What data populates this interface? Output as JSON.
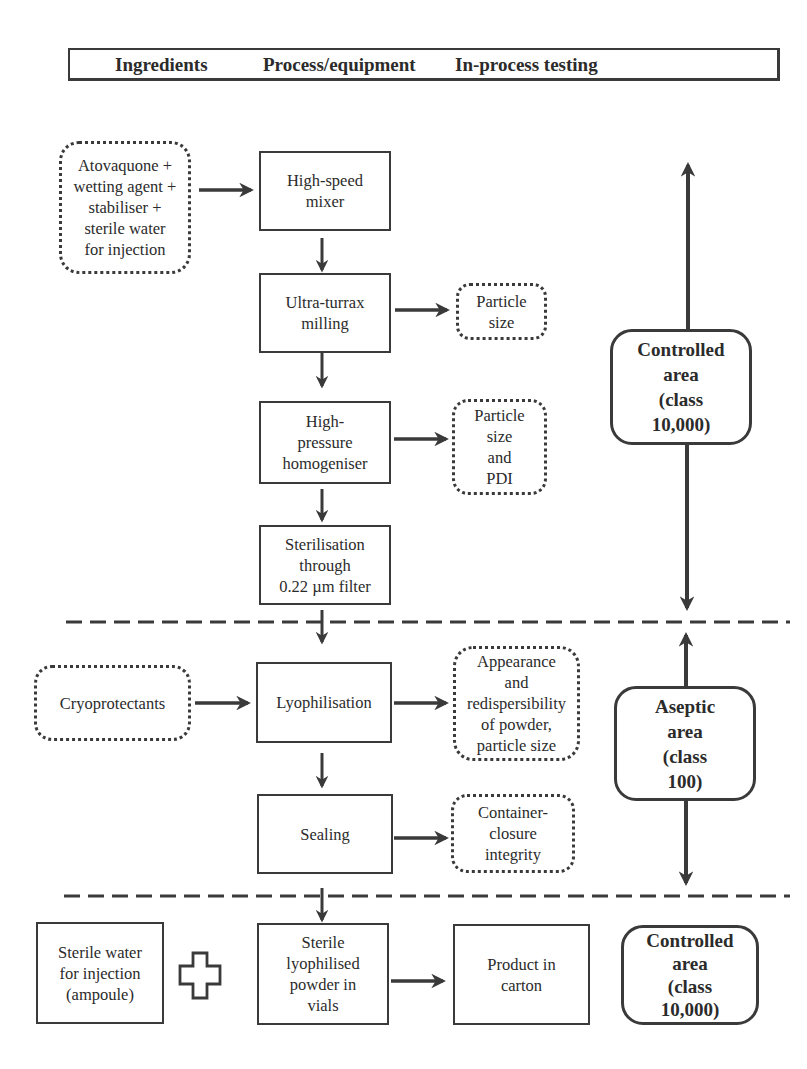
{
  "header": {
    "col1": "Ingredients",
    "col2": "Process/equipment",
    "col3": "In-process testing"
  },
  "ingredients": {
    "main_mix": "Atovaquone +\nwetting agent +\nstabiliser +\nsterile water\nfor injection",
    "cryoprotectants": "Cryoprotectants",
    "sterile_water_ampoule": "Sterile water\nfor injection\n(ampoule)"
  },
  "process": {
    "high_speed_mixer": "High-speed\nmixer",
    "ultra_turrax": "Ultra-turrax\nmilling",
    "hp_homogeniser": "High-\npressure\nhomogeniser",
    "sterilisation": "Sterilisation\nthrough\n0.22 µm filter",
    "lyophilisation": "Lyophilisation",
    "sealing": "Sealing",
    "sterile_powder": "Sterile\nlyophilised\npowder in\nvials",
    "product_carton": "Product in\ncarton"
  },
  "testing": {
    "particle_size_1": "Particle\nsize",
    "particle_size_pdi": "Particle\nsize\nand\nPDI",
    "appearance": "Appearance\nand\nredispersibility\nof powder,\nparticle size",
    "container_closure": "Container-\nclosure\nintegrity"
  },
  "areas": {
    "controlled_top": "Controlled\narea\n(class\n10,000)",
    "aseptic": "Aseptic\narea\n(class\n100)",
    "controlled_bottom": "Controlled\narea\n(class\n10,000)"
  },
  "icons": {
    "plus": "plus-outline-icon"
  },
  "colors": {
    "stroke": "#3a3a3a",
    "text": "#2b2b2b",
    "background": "#ffffff"
  }
}
